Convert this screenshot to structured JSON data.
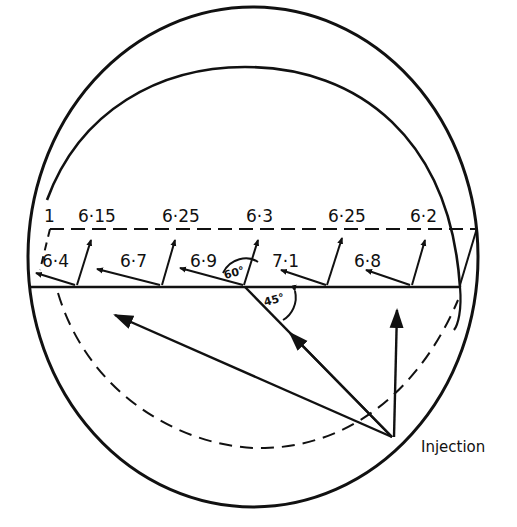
{
  "diagram": {
    "top_labels": [
      "1",
      "6·15",
      "6·25",
      "6·3",
      "6·25",
      "6·2"
    ],
    "bottom_labels": [
      "6·4",
      "6·7",
      "6·9",
      "7·1",
      "6·8"
    ],
    "angle_labels": {
      "sixty": "60°",
      "fortyfive": "45°"
    },
    "injection_label": "Injection",
    "colors": {
      "ink": "#111111",
      "background": "#ffffff"
    }
  }
}
